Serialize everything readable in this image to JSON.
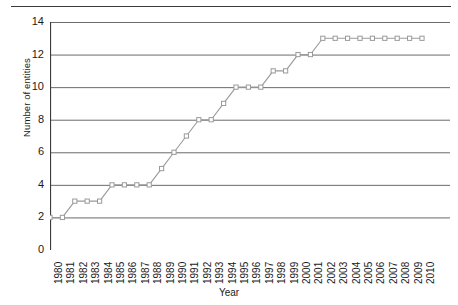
{
  "figure": {
    "has_top_rule": true,
    "background": "#ffffff"
  },
  "axis": {
    "y_title": "Number of entities",
    "x_title": "Year",
    "y_ticks": [
      "0",
      "2",
      "4",
      "6",
      "8",
      "10",
      "12",
      "14"
    ],
    "x_ticks": [
      "1980",
      "1981",
      "1982",
      "1983",
      "1984",
      "1985",
      "1986",
      "1987",
      "1988",
      "1989",
      "1990",
      "1991",
      "1992",
      "1993",
      "1994",
      "1995",
      "1996",
      "1997",
      "1998",
      "1999",
      "2000",
      "2001",
      "2002",
      "2003",
      "2004",
      "2005",
      "2006",
      "2007",
      "2008",
      "2009",
      "2010"
    ]
  },
  "style": {
    "line_color": "#9a9a9a",
    "marker_color": "#9a9a9a",
    "marker_fill": "#ffffff",
    "grid_color": "#6b6b6b",
    "axis_color": "#3a3a3a",
    "text_color": "#1a1a1a"
  },
  "chart_data": {
    "type": "line",
    "title": "",
    "xlabel": "Year",
    "ylabel": "Number of entities",
    "xlim": [
      1980,
      2010
    ],
    "ylim": [
      0,
      14
    ],
    "ytick_step": 2,
    "grid": true,
    "grid_axis": "y",
    "legend": false,
    "marker": "open-square",
    "x": [
      1980,
      1981,
      1982,
      1983,
      1984,
      1985,
      1986,
      1987,
      1988,
      1989,
      1990,
      1991,
      1992,
      1993,
      1994,
      1995,
      1996,
      1997,
      1998,
      1999,
      2000,
      2001,
      2002,
      2003,
      2004,
      2005,
      2006,
      2007,
      2008,
      2009,
      2010
    ],
    "values": [
      2,
      2,
      3,
      3,
      3,
      4,
      4,
      4,
      4,
      5,
      6,
      7,
      8,
      8,
      9,
      10,
      10,
      10,
      11,
      11,
      12,
      12,
      13,
      13,
      13,
      13,
      13,
      13,
      13,
      13,
      13
    ]
  }
}
